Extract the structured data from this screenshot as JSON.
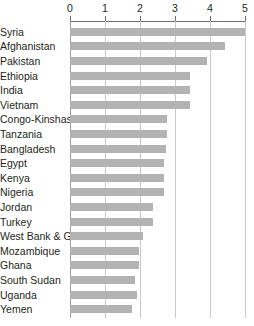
{
  "chart_data": {
    "type": "bar",
    "orientation": "horizontal",
    "title": "",
    "subtitle": "",
    "xlabel": "",
    "ylabel": "",
    "xlim": [
      0,
      5
    ],
    "xticks": [
      0,
      1,
      2,
      3,
      4,
      5
    ],
    "xtick_labels": [
      "0",
      "1",
      "2",
      "3",
      "4",
      "5"
    ],
    "grid": true,
    "grid_axis": "x",
    "legend": false,
    "legend_position": "none",
    "axis_position": "top",
    "bar_color": "#b3b3b3",
    "gridline_color": "#c9c9c9",
    "axis_color": "#6d6d6d",
    "text_color": "#231f20",
    "background_color": "#ffffff",
    "categories": [
      "Syria",
      "Afghanistan",
      "Pakistan",
      "Ethiopia",
      "India",
      "Vietnam",
      "Congo-Kinshasa",
      "Tanzania",
      "Bangladesh",
      "Egypt",
      "Kenya",
      "Nigeria",
      "Jordan",
      "Turkey",
      "West Bank & Gaza",
      "Mozambique",
      "Ghana",
      "South Sudan",
      "Uganda",
      "Yemen"
    ],
    "values": [
      5.0,
      4.42,
      3.92,
      3.43,
      3.43,
      3.43,
      2.77,
      2.77,
      2.74,
      2.69,
      2.69,
      2.69,
      2.37,
      2.37,
      2.09,
      1.98,
      1.98,
      1.86,
      1.91,
      1.77
    ]
  }
}
